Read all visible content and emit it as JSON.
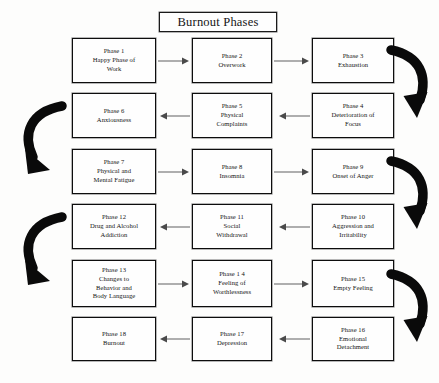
{
  "title": {
    "label": "Burnout Phases"
  },
  "colors": {
    "background": "#fdfdfc",
    "box_border": "#0d0d0d",
    "box_fill": "#fefefe",
    "text": "#141414",
    "thin_arrow": "#6e6e6e",
    "thick_arrow": "#0a0a0a"
  },
  "diagram": {
    "type": "serpentine-flowchart",
    "rows": 6,
    "columns": 3,
    "phases": [
      {
        "id": 1,
        "number_label": "Phase 1",
        "name": "Happy Phase of Work",
        "text": "Phase 1\nHappy Phase of\nWork",
        "row": 1,
        "column": "left"
      },
      {
        "id": 2,
        "number_label": "Phase 2",
        "name": "Overwork",
        "text": "Phase 2\nOverwork",
        "row": 1,
        "column": "mid"
      },
      {
        "id": 3,
        "number_label": "Phase 3",
        "name": "Exhaustion",
        "text": "Phase 3\nExhaustion",
        "row": 1,
        "column": "right"
      },
      {
        "id": 4,
        "number_label": "Phase 4",
        "name": "Deterioration of Focus",
        "text": "Phase 4\nDeterioration of\nFocus",
        "row": 2,
        "column": "right"
      },
      {
        "id": 5,
        "number_label": "Phase 5",
        "name": "Physical Complaints",
        "text": "Phase 5\nPhysical\nComplaints",
        "row": 2,
        "column": "mid"
      },
      {
        "id": 6,
        "number_label": "Phase 6",
        "name": "Anxiousness",
        "text": "Phase 6\nAnxiousness",
        "row": 2,
        "column": "left"
      },
      {
        "id": 7,
        "number_label": "Phase 7",
        "name": "Physical and Mental Fatigue",
        "text": "Phase 7\nPhysical and\nMental Fatigue",
        "row": 3,
        "column": "left"
      },
      {
        "id": 8,
        "number_label": "Phase 8",
        "name": "Insomnia",
        "text": "Phase 8\nInsomnia",
        "row": 3,
        "column": "mid"
      },
      {
        "id": 9,
        "number_label": "Phase 9",
        "name": "Onset of Anger",
        "text": "Phase 9\nOnset of Anger",
        "row": 3,
        "column": "right"
      },
      {
        "id": 10,
        "number_label": "Phase 10",
        "name": "Aggression and Irritability",
        "text": "Phase 10\nAggression and\nIrritability",
        "row": 4,
        "column": "right"
      },
      {
        "id": 11,
        "number_label": "Phase 11",
        "name": "Social Withdrawal",
        "text": "Phase 11\nSocial\nWithdrawal",
        "row": 4,
        "column": "mid"
      },
      {
        "id": 12,
        "number_label": "Phase 12",
        "name": "Drug and Alcohol Addiction",
        "text": "Phase 12\nDrug and Alcohol\nAddiction",
        "row": 4,
        "column": "left"
      },
      {
        "id": 13,
        "number_label": "Phase 13",
        "name": "Changes to Behavior and Body Language",
        "text": "Phase 13\nChanges to\nBehavior and\nBody Language",
        "row": 5,
        "column": "left"
      },
      {
        "id": 14,
        "number_label": "Phase 1 4",
        "name": "Feeling of Worthlessness",
        "text": "Phase 1 4\nFeeling of\nWorthlessness",
        "row": 5,
        "column": "mid"
      },
      {
        "id": 15,
        "number_label": "Phase 15",
        "name": "Empty Feeling",
        "text": "Phase 15\nEmpty Feeling",
        "row": 5,
        "column": "right"
      },
      {
        "id": 16,
        "number_label": "Phase 16",
        "name": "Emotional Detachment",
        "text": "Phase 16\nEmotional\nDetachment",
        "row": 6,
        "column": "right"
      },
      {
        "id": 17,
        "number_label": "Phase 17",
        "name": "Depression",
        "text": "Phase 17\nDepression",
        "row": 6,
        "column": "mid"
      },
      {
        "id": 18,
        "number_label": "Phase 18",
        "name": "Burnout",
        "text": "Phase 18\nBurnout",
        "row": 6,
        "column": "left"
      }
    ],
    "connectors": [
      {
        "id": "a1-2",
        "kind": "straight",
        "direction": "right",
        "from": 1,
        "to": 2
      },
      {
        "id": "a2-3",
        "kind": "straight",
        "direction": "right",
        "from": 2,
        "to": 3
      },
      {
        "id": "c3-4",
        "kind": "curve",
        "direction": "right-wrap-down",
        "from": 3,
        "to": 4
      },
      {
        "id": "a4-5",
        "kind": "straight",
        "direction": "left",
        "from": 4,
        "to": 5
      },
      {
        "id": "a5-6",
        "kind": "straight",
        "direction": "left",
        "from": 5,
        "to": 6
      },
      {
        "id": "c6-7",
        "kind": "curve",
        "direction": "left-wrap-down",
        "from": 6,
        "to": 7
      },
      {
        "id": "a7-8",
        "kind": "straight",
        "direction": "right",
        "from": 7,
        "to": 8
      },
      {
        "id": "a8-9",
        "kind": "straight",
        "direction": "right",
        "from": 8,
        "to": 9
      },
      {
        "id": "c9-10",
        "kind": "curve",
        "direction": "right-wrap-down",
        "from": 9,
        "to": 10
      },
      {
        "id": "a10-11",
        "kind": "straight",
        "direction": "left",
        "from": 10,
        "to": 11
      },
      {
        "id": "a11-12",
        "kind": "straight",
        "direction": "left",
        "from": 11,
        "to": 12
      },
      {
        "id": "c12-13",
        "kind": "curve",
        "direction": "left-wrap-down",
        "from": 12,
        "to": 13
      },
      {
        "id": "a13-14",
        "kind": "straight",
        "direction": "right",
        "from": 13,
        "to": 14
      },
      {
        "id": "a14-15",
        "kind": "straight",
        "direction": "right",
        "from": 14,
        "to": 15
      },
      {
        "id": "c15-16",
        "kind": "curve",
        "direction": "right-wrap-down",
        "from": 15,
        "to": 16
      },
      {
        "id": "a16-17",
        "kind": "straight",
        "direction": "left",
        "from": 16,
        "to": 17
      },
      {
        "id": "a17-18",
        "kind": "straight",
        "direction": "left",
        "from": 17,
        "to": 18
      }
    ]
  }
}
